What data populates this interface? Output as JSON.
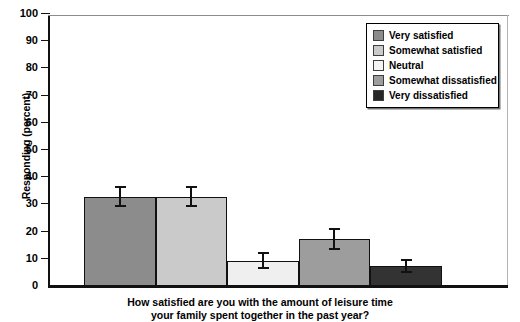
{
  "chart_data": {
    "type": "bar",
    "title": "",
    "categories": [
      "Very satisfied",
      "Somewhat satisfied",
      "Neutral",
      "Somewhat dissatisfied",
      "Very dissatisfied"
    ],
    "values": [
      32.5,
      32.5,
      9,
      17,
      7
    ],
    "errors": [
      4,
      4,
      3,
      4,
      2.5
    ],
    "colors": [
      "#8c8c8c",
      "#cacaca",
      "#efefef",
      "#9d9d9d",
      "#333333"
    ],
    "xlabel": "How satisfied are you with the amount of leisure time your family spent together in the past year?",
    "ylabel": "Responding (percent)",
    "ylim": [
      0,
      100
    ],
    "yticks": [
      0,
      10,
      20,
      30,
      40,
      50,
      60,
      70,
      80,
      90,
      100
    ],
    "ytick_labels": [
      "0",
      "10",
      "20",
      "30",
      "40",
      "50",
      "60",
      "70",
      "80",
      "90",
      "100"
    ],
    "grid": false,
    "legend_position": "top-right",
    "error_bar_style": "I-beam"
  },
  "axis": {
    "y_title": "Responding (percent)",
    "ticks": [
      "100",
      "90",
      "80",
      "70",
      "60",
      "50",
      "40",
      "30",
      "20",
      "10",
      "0"
    ]
  },
  "legend": {
    "items": [
      {
        "label": "Very satisfied",
        "color": "#8c8c8c"
      },
      {
        "label": "Somewhat satisfied",
        "color": "#cacaca"
      },
      {
        "label": "Neutral",
        "color": "#f4f4f4"
      },
      {
        "label": "Somewhat dissatisfied",
        "color": "#9d9d9d"
      },
      {
        "label": "Very dissatisfied",
        "color": "#262626"
      }
    ]
  },
  "caption": {
    "line1": "How satisfied are you with the amount of leisure time",
    "line2": "your family spent together in the past year?"
  }
}
